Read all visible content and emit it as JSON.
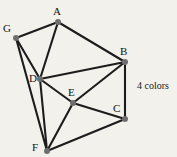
{
  "figure": {
    "background_color": "#f2f1ec",
    "edge_color": "#1c1c1c",
    "vertex_color": "#6e6e6e",
    "label_color": "#111111"
  },
  "annotation": {
    "text": "4 colors",
    "x": 137,
    "y": 80
  },
  "chart_data": {
    "type": "diagram",
    "title": "",
    "nodes": [
      {
        "id": "A",
        "label": "A",
        "x": 58,
        "y": 22,
        "label_x": 53,
        "label_y": 6
      },
      {
        "id": "B",
        "label": "B",
        "x": 125,
        "y": 62,
        "label_x": 120,
        "label_y": 46
      },
      {
        "id": "C",
        "label": "C",
        "x": 125,
        "y": 119,
        "label_x": 113,
        "label_y": 103
      },
      {
        "id": "D",
        "label": "D",
        "x": 40,
        "y": 79,
        "label_x": 29,
        "label_y": 73
      },
      {
        "id": "E",
        "label": "E",
        "x": 73,
        "y": 103,
        "label_x": 68,
        "label_y": 87
      },
      {
        "id": "F",
        "label": "F",
        "x": 47,
        "y": 151,
        "label_x": 32,
        "label_y": 142
      },
      {
        "id": "G",
        "label": "G",
        "x": 16,
        "y": 38,
        "label_x": 3,
        "label_y": 23
      }
    ],
    "edges": [
      {
        "from": "A",
        "to": "G"
      },
      {
        "from": "A",
        "to": "D"
      },
      {
        "from": "A",
        "to": "B"
      },
      {
        "from": "G",
        "to": "D"
      },
      {
        "from": "G",
        "to": "F"
      },
      {
        "from": "D",
        "to": "B"
      },
      {
        "from": "D",
        "to": "E"
      },
      {
        "from": "D",
        "to": "F"
      },
      {
        "from": "B",
        "to": "E"
      },
      {
        "from": "B",
        "to": "C"
      },
      {
        "from": "E",
        "to": "C"
      },
      {
        "from": "E",
        "to": "F"
      },
      {
        "from": "F",
        "to": "C"
      }
    ],
    "vertex_count": 7,
    "edge_count": 13,
    "chromatic_number": 4
  }
}
